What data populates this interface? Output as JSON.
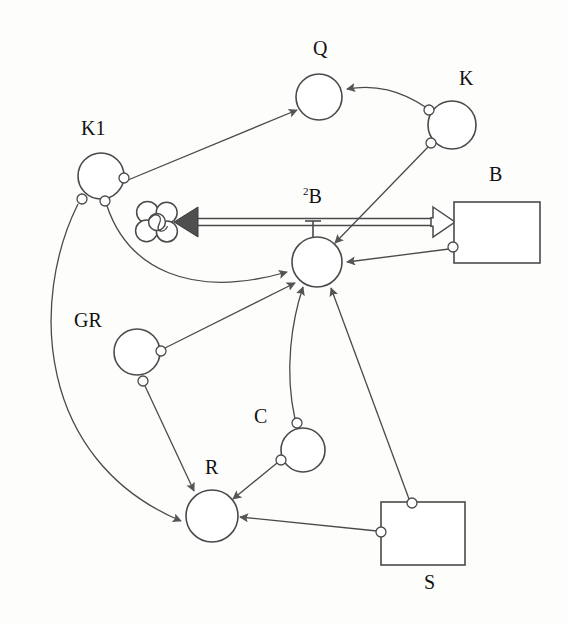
{
  "diagram": {
    "width": 568,
    "height": 624,
    "background_color": "#fdfdfc",
    "stroke_color": "#4a4a4a",
    "fill_color": "#ffffff",
    "arrow_fill_color": "#555555",
    "label_color": "#111111"
  },
  "nodes": [
    {
      "id": "Q",
      "label": "Q",
      "shape": "circle",
      "cx": 319,
      "cy": 97,
      "r": 23,
      "label_x": 313,
      "label_y": 38
    },
    {
      "id": "K",
      "label": "K",
      "shape": "circle",
      "cx": 452,
      "cy": 125,
      "r": 24,
      "label_x": 459,
      "label_y": 68
    },
    {
      "id": "K1",
      "label": "K1",
      "shape": "circle",
      "cx": 101,
      "cy": 176,
      "r": 23,
      "label_x": 81,
      "label_y": 118
    },
    {
      "id": "2B",
      "label": "B",
      "label_superscript": "2",
      "shape": "circle",
      "cx": 317,
      "cy": 262,
      "r": 25,
      "label_x": 303,
      "label_y": 186
    },
    {
      "id": "B",
      "label": "B",
      "shape": "rect",
      "x": 454,
      "y": 202,
      "width": 86,
      "height": 61,
      "label_x": 489,
      "label_y": 164
    },
    {
      "id": "GR",
      "label": "GR",
      "shape": "circle",
      "cx": 137,
      "cy": 352,
      "r": 23,
      "label_x": 74,
      "label_y": 310
    },
    {
      "id": "C",
      "label": "C",
      "shape": "circle",
      "cx": 303,
      "cy": 450,
      "r": 22,
      "label_x": 254,
      "label_y": 406
    },
    {
      "id": "R",
      "label": "R",
      "shape": "circle",
      "cx": 212,
      "cy": 516,
      "r": 26,
      "label_x": 205,
      "label_y": 457
    },
    {
      "id": "S",
      "label": "S",
      "shape": "rect",
      "x": 381,
      "y": 502,
      "width": 84,
      "height": 63,
      "label_x": 424,
      "label_y": 572
    },
    {
      "id": "cloud",
      "label": "",
      "shape": "cloud",
      "cx": 157,
      "cy": 222,
      "r": 21
    }
  ],
  "ports": [
    {
      "id": "k1-right",
      "node": "K1",
      "cx": 124,
      "cy": 178,
      "r": 5
    },
    {
      "id": "k1-bot-left",
      "node": "K1",
      "cx": 82,
      "cy": 199,
      "r": 5
    },
    {
      "id": "k1-bot-right",
      "node": "K1",
      "cx": 105,
      "cy": 201,
      "r": 5
    },
    {
      "id": "k-top-left",
      "node": "K",
      "cx": 429,
      "cy": 110,
      "r": 5
    },
    {
      "id": "k-bot-left",
      "node": "K",
      "cx": 431,
      "cy": 143,
      "r": 5
    },
    {
      "id": "b-left",
      "node": "B",
      "cx": 453,
      "cy": 247,
      "r": 5
    },
    {
      "id": "gr-right",
      "node": "GR",
      "cx": 161,
      "cy": 351,
      "r": 5
    },
    {
      "id": "gr-bottom",
      "node": "GR",
      "cx": 143,
      "cy": 381,
      "r": 5
    },
    {
      "id": "c-top",
      "node": "C",
      "cx": 297,
      "cy": 423,
      "r": 5
    },
    {
      "id": "c-bot-left",
      "node": "C",
      "cx": 281,
      "cy": 460,
      "r": 5
    },
    {
      "id": "s-top",
      "node": "S",
      "cx": 412,
      "cy": 503,
      "r": 5
    },
    {
      "id": "s-left",
      "node": "S",
      "cx": 381,
      "cy": 532,
      "r": 5
    }
  ],
  "edges": [
    {
      "id": "k1-to-q",
      "from": "K1",
      "to": "Q",
      "style": "thin-arrow",
      "arrow": "filled",
      "path": "M 128 180 L 297 110"
    },
    {
      "id": "k-to-q",
      "from": "K",
      "to": "Q",
      "style": "thin-arrow",
      "arrow": "filled",
      "path": "M 427 108 C 400 90 375 84 347 89"
    },
    {
      "id": "k-to-2b",
      "from": "K",
      "to": "2B",
      "style": "thin-arrow",
      "arrow": "filled",
      "path": "M 428 147 L 335 243"
    },
    {
      "id": "k1-to-2b",
      "from": "K1",
      "to": "2B",
      "style": "thin-curve",
      "arrow": "filled",
      "path": "M 107 206 C 128 268 190 300 287 272"
    },
    {
      "id": "k1-to-r",
      "from": "K1",
      "to": "R",
      "style": "thin-curve",
      "arrow": "filled",
      "path": "M 78 204 C 30 300 36 460 181 521"
    },
    {
      "id": "b-to-2b",
      "from": "B",
      "to": "2B",
      "style": "thin-arrow",
      "arrow": "filled",
      "path": "M 449 249 L 347 262"
    },
    {
      "id": "b-to-cloud",
      "from": "B",
      "to": "cloud",
      "style": "double-line",
      "arrow": "double-headed",
      "path": "M 196 222 L 455 222"
    },
    {
      "id": "gr-to-2b",
      "from": "GR",
      "to": "2B",
      "style": "thin-arrow",
      "arrow": "filled",
      "path": "M 165 348 L 295 283"
    },
    {
      "id": "gr-to-r",
      "from": "GR",
      "to": "R",
      "style": "thin-arrow",
      "arrow": "filled",
      "path": "M 145 386 L 194 491"
    },
    {
      "id": "c-to-2b",
      "from": "C",
      "to": "2B",
      "style": "thin-curve",
      "arrow": "filled",
      "path": "M 295 419 C 284 370 292 320 303 287"
    },
    {
      "id": "c-to-r",
      "from": "C",
      "to": "R",
      "style": "thin-arrow",
      "arrow": "filled",
      "path": "M 277 463 L 233 499"
    },
    {
      "id": "s-to-2b",
      "from": "S",
      "to": "2B",
      "style": "thin-arrow",
      "arrow": "filled",
      "path": "M 409 499 L 331 288"
    },
    {
      "id": "s-to-r",
      "from": "S",
      "to": "R",
      "style": "thin-arrow",
      "arrow": "filled",
      "path": "M 377 531 L 240 517"
    }
  ],
  "stem": {
    "id": "2b-stem",
    "description": "T-shaped stem from 2B circle up to the double line",
    "x": 313,
    "y_top": 221,
    "y_bottom": 238,
    "cap_half_width": 8
  },
  "legend": {
    "node_count": 9,
    "edge_count": 13
  }
}
